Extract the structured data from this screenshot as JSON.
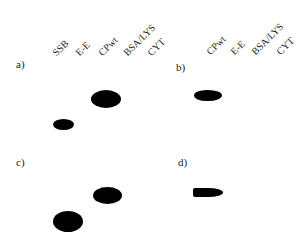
{
  "figure": {
    "lanes_left": [
      "SSB",
      "E-E",
      "CPwt",
      "BSA/LYS",
      "CYT"
    ],
    "lanes_right": [
      "CPwt",
      "E-E",
      "BSA/LYS",
      "CYT"
    ],
    "panels": [
      {
        "label": "a)",
        "spots": [
          "CPwt",
          "SSB"
        ]
      },
      {
        "label": "b)",
        "spots": [
          "CPwt"
        ]
      },
      {
        "label": "c)",
        "spots": [
          "CPwt",
          "SSB"
        ]
      },
      {
        "label": "d)",
        "spots": [
          "CPwt"
        ]
      }
    ]
  }
}
